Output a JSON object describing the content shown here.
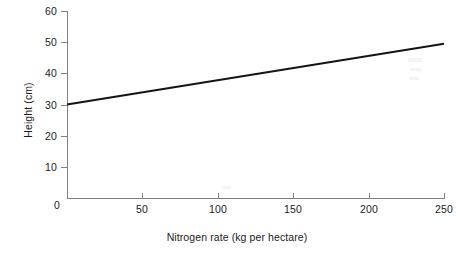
{
  "chart_data": {
    "type": "line",
    "title": "",
    "xlabel": "Nitrogen rate (kg per hectare)",
    "ylabel": "Height (cm)",
    "xlim": [
      0,
      250
    ],
    "ylim": [
      0,
      60
    ],
    "xticks": [
      0,
      50,
      100,
      150,
      200,
      250
    ],
    "xtick_labels": [
      "0",
      "50",
      "100",
      "150",
      "200",
      "250"
    ],
    "yticks": [
      0,
      10,
      20,
      30,
      40,
      50,
      60
    ],
    "ytick_labels": [
      "0",
      "10",
      "20",
      "30",
      "40",
      "50",
      "60"
    ],
    "grid": false,
    "legend": null,
    "series": [
      {
        "name": "Height vs nitrogen rate",
        "color": "#141414",
        "x": [
          0,
          50,
          100,
          150,
          200,
          250
        ],
        "values": [
          30.0,
          34.9,
          39.8,
          44.7,
          49.5,
          49.5
        ]
      }
    ],
    "line_endpoints": {
      "x_start": 0,
      "y_start": 30.0,
      "x_end": 250,
      "y_end": 49.5
    },
    "annotations": []
  },
  "axes": {
    "axis_color": "#818181",
    "tick_color": "#818181",
    "text_color": "#1b1b1b",
    "background": "#ffffff"
  },
  "labels": {
    "x_title": "Nitrogen rate (kg per hectare)",
    "y_title": "Height (cm)",
    "origin": "0"
  }
}
